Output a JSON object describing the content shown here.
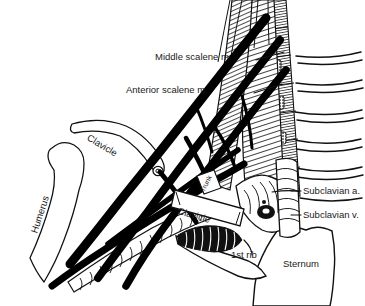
{
  "figure": {
    "background_color": "#ffffff",
    "ink_color": "#000000",
    "text_color": "#1a1a1a"
  },
  "labels": {
    "middle_scalene": "Middle scalene m.",
    "anterior_scalene": "Anterior scalene m.",
    "clavicle_upper": "Clavicle",
    "clavicle_cut": "Clavicle",
    "humerus": "Humerus",
    "trunk": "Trunk",
    "subclavian_artery": "Subclavian a.",
    "subclavian_vein": "Subclavian v.",
    "first_rib": "1st rib",
    "sternum": "Sternum"
  },
  "structures": {
    "nerve_cords": "brachial-plexus-cords",
    "scalene_bands": "hatched-muscle-bands",
    "vertebral_column": "cervical-vertebrae",
    "ribs": "rib-arcs",
    "vessels": "ringed-tubular-vessels"
  }
}
